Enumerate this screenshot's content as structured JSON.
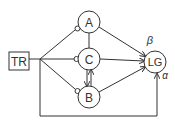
{
  "nodes": {
    "tr": {
      "label": "TR"
    },
    "a": {
      "label": "A"
    },
    "c": {
      "label": "C"
    },
    "b": {
      "label": "B"
    },
    "lg": {
      "label": "LG"
    }
  },
  "edge_labels": {
    "beta": "β",
    "alpha": "α"
  },
  "colors": {
    "stroke": "#333333",
    "background": "#ffffff"
  }
}
